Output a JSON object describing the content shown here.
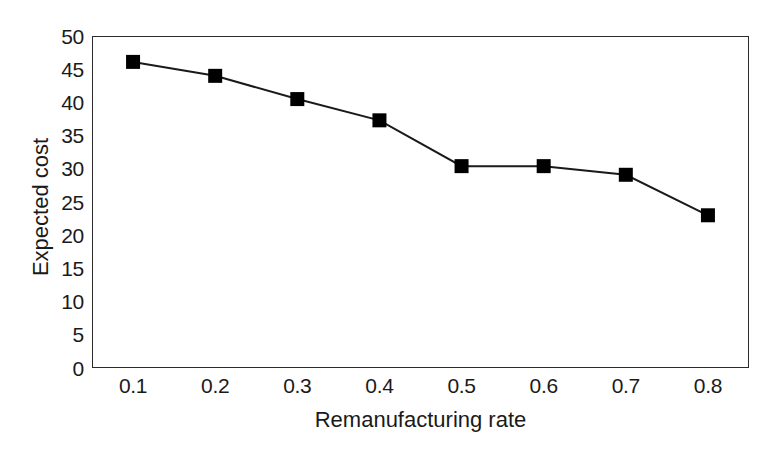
{
  "chart_data": {
    "type": "line",
    "title": "",
    "xlabel": "Remanufacturing rate",
    "ylabel": "Expected cost",
    "x": [
      0.1,
      0.2,
      0.3,
      0.4,
      0.5,
      0.6,
      0.7,
      0.8
    ],
    "values": [
      46.1,
      44.0,
      40.5,
      37.3,
      30.4,
      30.4,
      29.1,
      23.0
    ],
    "series": [
      {
        "name": "Expected cost",
        "values": [
          46.1,
          44.0,
          40.5,
          37.3,
          30.4,
          30.4,
          29.1,
          23.0
        ]
      }
    ],
    "xtick_labels": [
      "0.1",
      "0.2",
      "0.3",
      "0.4",
      "0.5",
      "0.6",
      "0.7",
      "0.8"
    ],
    "ytick_labels": [
      "0",
      "5",
      "10",
      "15",
      "20",
      "25",
      "30",
      "35",
      "40",
      "45",
      "50"
    ],
    "ytick_values": [
      0,
      5,
      10,
      15,
      20,
      25,
      30,
      35,
      40,
      45,
      50
    ],
    "xlim": [
      0.05,
      0.85
    ],
    "ylim": [
      0,
      50
    ],
    "grid": false,
    "legend": false,
    "marker": "square",
    "marker_color": "#000000",
    "line_color": "#1a1a1a",
    "frame_color": "#2b2b2b",
    "background_color": "#ffffff"
  }
}
